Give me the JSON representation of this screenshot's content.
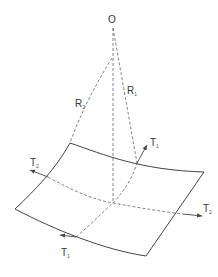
{
  "diagram": {
    "labels": {
      "origin": "O",
      "r2": {
        "main": "R",
        "sub": "2"
      },
      "r1": {
        "main": "R",
        "sub": "1"
      },
      "t_upper_right": {
        "main": "T",
        "sub": "1"
      },
      "t_left": {
        "main": "T",
        "sub": "2"
      },
      "t_right": {
        "main": "T",
        "sub": "2"
      },
      "t_bottom": {
        "main": "T",
        "sub": "1"
      }
    },
    "colors": {
      "line": "#444444",
      "dashed": "#666666",
      "text": "#333333"
    }
  }
}
